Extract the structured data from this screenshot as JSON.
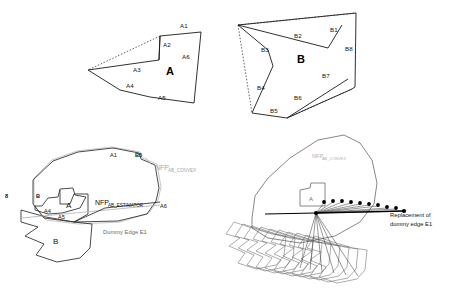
{
  "figure": {
    "background": "#ffffff",
    "width": 449,
    "height": 293,
    "stroke_dark": "#1a1a1a",
    "stroke_mid": "#5a5a5a",
    "stroke_light": "#b8b8b8",
    "text_dark": "#111111",
    "text_gray": "#9a9a9a"
  },
  "panels": {
    "top_left": {
      "name": "polygon-a",
      "center_label": "A",
      "edge_labels": [
        "A1",
        "A2",
        "A3",
        "A4",
        "A5",
        "A6"
      ]
    },
    "top_right": {
      "name": "polygon-b",
      "center_label": "B",
      "edge_labels": [
        "B1",
        "B2",
        "B3",
        "B4",
        "B5",
        "B6",
        "B7",
        "B8"
      ]
    },
    "bottom_left": {
      "name": "nfp-with-dummy-edge",
      "labels": {
        "nfp_convex_base": "NFP",
        "nfp_convex_sub": "AB_CONVEX",
        "nfp_estimator_base": "NFP",
        "nfp_estimator_sub": "AB_ESTIMATOR",
        "dummy_edge": "Dummy Edge E1",
        "poly_a": "A",
        "poly_b": "B"
      },
      "edge_labels": [
        "A1",
        "B5",
        "B8",
        "A4",
        "A5",
        "A6"
      ]
    },
    "bottom_right": {
      "name": "dummy-edge-replacement",
      "labels": {
        "nfp_convex_base": "NFP",
        "nfp_convex_sub": "AB_CONVEX",
        "poly_a": "A",
        "replacement_line1": "Replacement of",
        "replacement_line2": "dummy edge E1"
      },
      "trace_point_count": 10
    }
  }
}
